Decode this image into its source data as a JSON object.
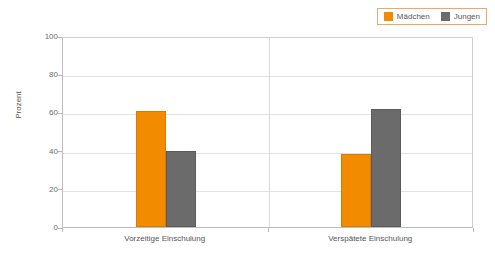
{
  "chart_data": {
    "type": "bar",
    "title": "",
    "xlabel": "",
    "ylabel": "Prozent",
    "categories": [
      "Vorzeitige Einschulung",
      "Verspätete Einschulung"
    ],
    "series": [
      {
        "name": "Mädchen",
        "color": "#f38b00",
        "values": [
          61,
          38
        ]
      },
      {
        "name": "Jungen",
        "color": "#6b6b6b",
        "values": [
          40,
          62
        ]
      }
    ],
    "ylim": [
      0,
      100
    ],
    "yticks": [
      0,
      20,
      40,
      60,
      80,
      100
    ],
    "ytick_labels": [
      "0",
      "20",
      "40",
      "60",
      "80",
      "100"
    ],
    "grid": true,
    "legend_position": "top-right"
  },
  "legend": {
    "entries": [
      {
        "label": "Mädchen",
        "swatch": "legend-swatch-maedchen"
      },
      {
        "label": "Jungen",
        "swatch": "legend-swatch-jungen"
      }
    ]
  },
  "axis": {
    "y_title": "Prozent",
    "y_ticks": [
      "100",
      "80",
      "60",
      "40",
      "20",
      "0"
    ],
    "x_categories": [
      "Vorzeitige Einschulung",
      "Verspätete Einschulung"
    ]
  },
  "colors": {
    "maedchen": "#f38b00",
    "jungen": "#6b6b6b",
    "grid": "#e2e2e2",
    "axis": "#bdbdbd",
    "legend_border": "#e8a96a",
    "text": "#565656"
  }
}
